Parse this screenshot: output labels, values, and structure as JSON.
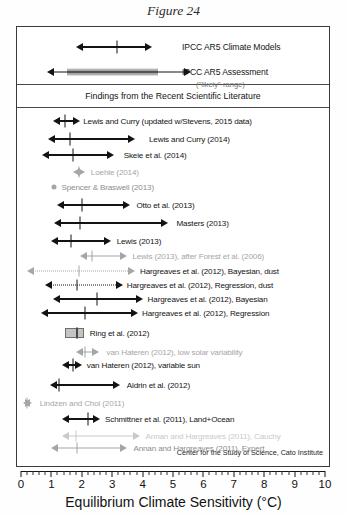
{
  "figure": {
    "caption": "Figure 24",
    "credit": "Center for the Study of Science, Cato Institute",
    "section_header": "Findings from the Recent Scientific Literature"
  },
  "axis": {
    "title": "Equilibrium Climate Sensitivity (°C)",
    "ticks": [
      "0",
      "1",
      "2",
      "3",
      "4",
      "5",
      "6",
      "7",
      "8",
      "9",
      "10"
    ],
    "min": 0,
    "max": 10,
    "minor_step": 0.2
  },
  "top_panel": {
    "models_label": "IPCC AR5 Climate Models",
    "assessment_label": "IPCC AR5 Assessment",
    "assessment_sub": "(\"likely\" range)"
  },
  "colors": {
    "dark": "#131313",
    "gray": "#a6a6a6",
    "midgray": "#8d8d8d",
    "lightgray": "#c9c9c9",
    "band": "#9a9a9a",
    "frame": "#3a3a3a"
  },
  "chart_data": {
    "type": "bar",
    "subtype": "horizontal-interval-range (forest plot)",
    "title": "Figure 24",
    "xlabel": "Equilibrium Climate Sensitivity (°C)",
    "ylabel": "",
    "xlim": [
      0,
      10
    ],
    "grid": false,
    "legend": "none",
    "series": [
      {
        "name": "IPCC AR5 Climate Models",
        "label": "IPCC AR5 Climate Models",
        "low": 1.8,
        "high": 4.3,
        "best": 3.15,
        "style": "dark-arrow-both",
        "panel": "top"
      },
      {
        "name": "IPCC AR5 Assessment",
        "label": "IPCC AR5 Assessment",
        "sub": "(\"likely\" range)",
        "low": 0.85,
        "high": 5.6,
        "band_low": 1.5,
        "band_high": 4.5,
        "best": null,
        "style": "dark-arrow-both-with-band",
        "panel": "top"
      },
      {
        "name": "Lewis and Curry updated",
        "label": "Lewis and Curry (updated w/Stevens, 2015 data)",
        "low": 1.05,
        "high": 1.95,
        "best": 1.45,
        "style": "dark-arrow-both"
      },
      {
        "name": "Lewis and Curry 2014",
        "label": "Lewis and Curry (2014)",
        "low": 0.9,
        "high": 3.75,
        "best": 1.6,
        "style": "dark-arrow-both"
      },
      {
        "name": "Skeie et al. 2014",
        "label": "Skeie et al. (2014)",
        "low": 0.7,
        "high": 3.05,
        "best": 1.7,
        "style": "dark-arrow-both"
      },
      {
        "name": "Loehle 2014",
        "label": "Loehle (2014)",
        "low": 1.7,
        "high": 2.1,
        "best": 1.9,
        "style": "gray-arrow-both"
      },
      {
        "name": "Spencer & Braswell 2013",
        "label": "Spencer & Braswell (2013)",
        "low": 1.1,
        "high": 1.1,
        "best": 1.1,
        "style": "gray-dot"
      },
      {
        "name": "Otto et al. 2013",
        "label": "Otto et al. (2013)",
        "low": 1.2,
        "high": 3.6,
        "best": 2.0,
        "style": "dark-arrow-both"
      },
      {
        "name": "Masters 2013",
        "label": "Masters (2013)",
        "low": 1.1,
        "high": 4.85,
        "best": 1.95,
        "style": "dark-arrow-both"
      },
      {
        "name": "Lewis 2013",
        "label": "Lewis (2013)",
        "low": 1.0,
        "high": 2.95,
        "best": 1.65,
        "style": "dark-arrow-both"
      },
      {
        "name": "Lewis 2013 after Forest",
        "label": "Lewis (2013), after Forest et al. (2006)",
        "low": 1.95,
        "high": 3.5,
        "best": 2.35,
        "style": "gray-arrow-both"
      },
      {
        "name": "Hargreaves 2012 Bayesian dust",
        "label": "Hargreaves et al. (2012), Bayesian, dust",
        "low": 0.2,
        "high": 3.75,
        "best": 1.9,
        "style": "gray-dotted-arrow-both"
      },
      {
        "name": "Hargreaves 2012 Regression dust",
        "label": "Hargreaves et al. (2012), Regression, dust",
        "low": 0.8,
        "high": 3.35,
        "best": 1.85,
        "style": "dark-dotted-arrow-both"
      },
      {
        "name": "Hargreaves 2012 Bayesian",
        "label": "Hargreaves et al. (2012), Bayesian",
        "low": 1.05,
        "high": 4.0,
        "best": 2.5,
        "style": "dark-arrow-both"
      },
      {
        "name": "Hargreaves 2012 Regression",
        "label": "Hargreaves et al. (2012), Regression",
        "low": 0.65,
        "high": 3.85,
        "best": 2.1,
        "style": "dark-arrow-both"
      },
      {
        "name": "Ring et al. 2012",
        "label": "Ring et al. (2012)",
        "low": 1.45,
        "high": 2.0,
        "best": 1.85,
        "style": "gray-box"
      },
      {
        "name": "van Hateren 2012 low solar",
        "label": "van Hateren (2012), low solar variability",
        "low": 1.8,
        "high": 2.55,
        "best": 2.1,
        "style": "gray-arrow-both"
      },
      {
        "name": "van Hateren 2012 variable sun",
        "label": "van Hateren (2012), variable sun",
        "low": 1.35,
        "high": 2.0,
        "best": 1.7,
        "style": "dark-arrow-both"
      },
      {
        "name": "Aldrin et al. 2012",
        "label": "Aldrin et al. (2012)",
        "low": 0.95,
        "high": 3.25,
        "best": 1.25,
        "style": "dark-arrow-both"
      },
      {
        "name": "Lindzen and Choi 2011",
        "label": "Lindzen and Choi  (2011)",
        "low": 0.05,
        "high": 0.35,
        "best": 0.2,
        "style": "gray-arrow-both"
      },
      {
        "name": "Schmittner et al. 2011 Land+Ocean",
        "label": "Schmittner et al.  (2011), Land+Ocean",
        "low": 1.35,
        "high": 2.6,
        "best": 2.2,
        "style": "dark-arrow-both"
      },
      {
        "name": "Annan and Hargreaves 2011 Cauchy",
        "label": "Annan and Hargreaves (2011), Cauchy",
        "low": 1.35,
        "high": 3.9,
        "best": 1.8,
        "style": "lightgray-arrow-both"
      },
      {
        "name": "Annan and Hargreaves 2011 Expert",
        "label": "Annan and Hargreaves (2011), Expert",
        "low": 1.0,
        "high": 3.5,
        "best": 1.85,
        "style": "gray-arrow-both"
      }
    ]
  }
}
